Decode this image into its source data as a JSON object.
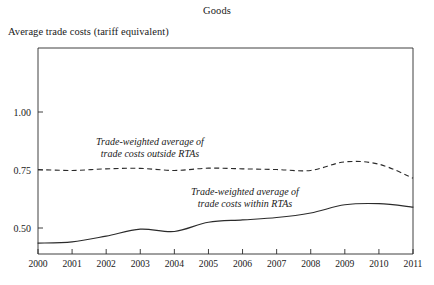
{
  "chart_data": {
    "type": "line",
    "title": "Goods",
    "ylabel": "Average trade costs (tariff equivalent)",
    "xlabel": "",
    "grid": false,
    "legend_position": "inline-annotations",
    "x": [
      2000,
      2001,
      2002,
      2003,
      2004,
      2005,
      2006,
      2007,
      2008,
      2009,
      2010,
      2011
    ],
    "xtick_labels": [
      "2000",
      "2001",
      "2002",
      "2003",
      "2004",
      "2005",
      "2006",
      "2007",
      "2008",
      "2009",
      "2010",
      "2011"
    ],
    "ytick_labels": [
      "0.50",
      "0.75",
      "1.00"
    ],
    "yticks": [
      0.5,
      0.75,
      1.0
    ],
    "ylim": [
      0.4,
      1.12
    ],
    "xlim": [
      2000,
      2011
    ],
    "series": [
      {
        "name": "Trade-weighted average of trade costs outside RTAs",
        "style": "dashed",
        "color": "#2b2b2b",
        "values": [
          0.752,
          0.748,
          0.755,
          0.757,
          0.748,
          0.758,
          0.755,
          0.752,
          0.748,
          0.785,
          0.775,
          0.715
        ]
      },
      {
        "name": "Trade-weighted average of trade costs within RTAs",
        "style": "solid",
        "color": "#2b2b2b",
        "values": [
          0.435,
          0.44,
          0.465,
          0.495,
          0.485,
          0.525,
          0.535,
          0.545,
          0.565,
          0.6,
          0.605,
          0.59
        ]
      }
    ],
    "annotations": [
      {
        "id": "outside",
        "line1": "Trade-weighted average of",
        "line2": "trade costs outside RTAs",
        "x_px": 150,
        "y_px": 145
      },
      {
        "id": "within",
        "line1": "Trade-weighted average of",
        "line2": "trade costs within RTAs",
        "x_px": 245,
        "y_px": 195
      }
    ]
  },
  "axis": {
    "y_ticks": [
      {
        "label": "1.00",
        "y_px": 112
      },
      {
        "label": "0.75",
        "y_px": 170
      },
      {
        "label": "0.50",
        "y_px": 228
      }
    ],
    "x_ticks": [
      {
        "label": "2000",
        "x_px": 44
      },
      {
        "label": "2001",
        "x_px": 77
      },
      {
        "label": "2002",
        "x_px": 111
      },
      {
        "label": "2003",
        "x_px": 145
      },
      {
        "label": "2004",
        "x_px": 178
      },
      {
        "label": "2005",
        "x_px": 212
      },
      {
        "label": "2006",
        "x_px": 246
      },
      {
        "label": "2007",
        "x_px": 279
      },
      {
        "label": "2008",
        "x_px": 313
      },
      {
        "label": "2009",
        "x_px": 346
      },
      {
        "label": "2010",
        "x_px": 380
      },
      {
        "label": "2011",
        "x_px": 413
      }
    ]
  },
  "colors": {
    "ink": "#2b2b2b",
    "background": "#ffffff"
  }
}
